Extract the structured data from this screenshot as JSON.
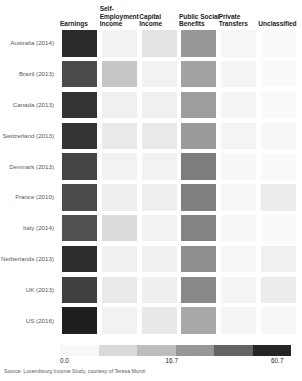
{
  "chart_data": {
    "type": "heatmap",
    "title": "",
    "xlabel": "",
    "ylabel": "",
    "grid": false,
    "legend_position": "bottom",
    "colormap": "greys",
    "colorbar": {
      "ticks": [
        "0.0",
        "16.7",
        "60.7"
      ],
      "tick_values": [
        0.0,
        16.7,
        60.7
      ],
      "vmin": 0.0,
      "vmax": 60.7,
      "n_segments": 6,
      "segment_colors": [
        "#f7f7f7",
        "#d9d9d9",
        "#bdbdbd",
        "#969696",
        "#636363",
        "#252525"
      ]
    },
    "columns": [
      "Earnings",
      "Self-\nEmployment\nIncome",
      "Capital\nIncome",
      "Public Social\nBenefits",
      "Private\nTransfers",
      "Unclassified"
    ],
    "column_labels_flat": [
      "Earnings",
      "Self-Employment Income",
      "Capital Income",
      "Public Social Benefits",
      "Private Transfers",
      "Unclassified"
    ],
    "rows": [
      "Australia (2014)",
      "Brazil (2013)",
      "Canada (2013)",
      "Switzerland (2013)",
      "Denmark (2013)",
      "France (2010)",
      "Italy (2014)",
      "Netherlands (2013)",
      "UK (2013)",
      "US (2016)"
    ],
    "values": [
      [
        58.0,
        3.0,
        8.0,
        27.0,
        1.5,
        0.5
      ],
      [
        46.0,
        22.0,
        3.0,
        24.0,
        2.0,
        0.5
      ],
      [
        55.0,
        4.0,
        4.0,
        25.0,
        2.0,
        0.5
      ],
      [
        54.0,
        6.0,
        6.0,
        26.0,
        2.0,
        1.0
      ],
      [
        48.0,
        3.0,
        3.0,
        33.0,
        1.0,
        0.5
      ],
      [
        46.0,
        5.0,
        5.0,
        32.0,
        1.5,
        6.0
      ],
      [
        43.0,
        14.0,
        4.0,
        31.0,
        1.0,
        0.5
      ],
      [
        57.0,
        4.0,
        4.0,
        28.0,
        1.5,
        3.0
      ],
      [
        50.0,
        6.0,
        5.0,
        29.0,
        2.0,
        4.0
      ],
      [
        60.7,
        4.0,
        7.0,
        20.0,
        2.0,
        1.0
      ]
    ],
    "cell_colors": [
      [
        "#2b2b2b",
        "#f2f2f2",
        "#e3e3e3",
        "#979797",
        "#f6f6f6",
        "#fafafa"
      ],
      [
        "#4b4b4b",
        "#c6c6c6",
        "#f2f2f2",
        "#a2a2a2",
        "#f5f5f5",
        "#fafafa"
      ],
      [
        "#333333",
        "#f0f0f0",
        "#f0f0f0",
        "#9d9d9d",
        "#f5f5f5",
        "#fafafa"
      ],
      [
        "#343434",
        "#eaeaea",
        "#eaeaea",
        "#9a9a9a",
        "#f4f4f4",
        "#f7f7f7"
      ],
      [
        "#444444",
        "#f2f2f2",
        "#f2f2f2",
        "#7d7d7d",
        "#f7f7f7",
        "#fafafa"
      ],
      [
        "#4b4b4b",
        "#eeeeee",
        "#eeeeee",
        "#7f7f7f",
        "#f6f6f6",
        "#ededed"
      ],
      [
        "#525252",
        "#dcdcdc",
        "#f2f2f2",
        "#848484",
        "#f7f7f7",
        "#fafafa"
      ],
      [
        "#2e2e2e",
        "#f1f1f1",
        "#f1f1f1",
        "#8f8f8f",
        "#f6f6f6",
        "#f0f0f0"
      ],
      [
        "#404040",
        "#eaeaea",
        "#efefef",
        "#888888",
        "#f5f5f5",
        "#ececec"
      ],
      [
        "#1f1f1f",
        "#f2f2f2",
        "#e8e8e8",
        "#a9a9a9",
        "#f5f5f5",
        "#f7f7f7"
      ]
    ]
  },
  "source_note": "Source: Luxembourg Income Study, courtesy of Teresa Munzi"
}
